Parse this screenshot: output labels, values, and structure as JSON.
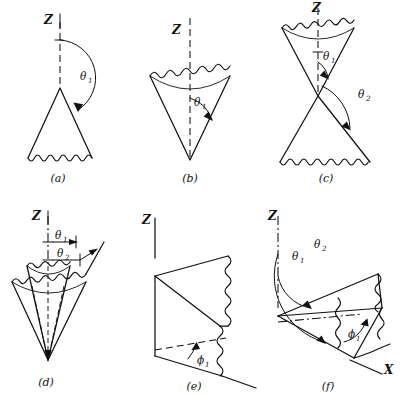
{
  "figure": {
    "background_color": "#ffffff",
    "ink_color": "#111111",
    "grid": {
      "rows": 2,
      "cols": 3
    }
  },
  "panels": [
    {
      "id": "a",
      "caption": "(a)",
      "description": "Cone with apex up, wavy circular base, angle theta-1 from Z axis to slant surface",
      "axis_label": "Z",
      "angles": [
        {
          "symbol": "θ",
          "subscript": "1"
        }
      ]
    },
    {
      "id": "b",
      "caption": "(b)",
      "description": "Inverted cone, apex down, wavy elliptical top rim, angle theta-1 between Z axis and slant surface",
      "axis_label": "Z",
      "angles": [
        {
          "symbol": "θ",
          "subscript": "1"
        }
      ]
    },
    {
      "id": "c",
      "caption": "(c)",
      "description": "Double cone sharing a common apex, theta-1 for the upper cone and theta-2 for the lower cone",
      "axis_label": "Z",
      "angles": [
        {
          "symbol": "θ",
          "subscript": "1"
        },
        {
          "symbol": "θ",
          "subscript": "2"
        }
      ]
    },
    {
      "id": "d",
      "caption": "(d)",
      "description": "Two nested inverted cones with common apex bounding a conical shell between theta-1 and theta-2",
      "axis_label": "Z",
      "angles": [
        {
          "symbol": "θ",
          "subscript": "1"
        },
        {
          "symbol": "θ",
          "subscript": "2"
        }
      ]
    },
    {
      "id": "e",
      "caption": "(e)",
      "description": "Half plane of constant azimuth phi-1 containing the Z axis, wavy cut edge",
      "axis_label": "Z",
      "angles": [
        {
          "symbol": "ϕ",
          "subscript": "1"
        }
      ]
    },
    {
      "id": "f",
      "caption": "(f)",
      "description": "Wedge region bounded by cones theta-1 and theta-2 and azimuth phi-1, with Z and X axes",
      "axis_label": "Z",
      "axis_label_x": "X",
      "angles": [
        {
          "symbol": "θ",
          "subscript": "1"
        },
        {
          "symbol": "θ",
          "subscript": "2"
        },
        {
          "symbol": "ϕ",
          "subscript": "1"
        }
      ]
    }
  ]
}
